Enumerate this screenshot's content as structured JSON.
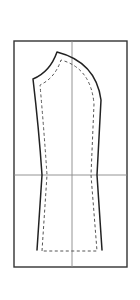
{
  "diagram": {
    "type": "sewing-pattern",
    "colors": {
      "frame": "#333333",
      "guide": "#888888",
      "outline": "#222222",
      "seam_allowance": "#555555",
      "background": "#ffffff"
    },
    "elements": [
      {
        "name": "outer-frame",
        "style": "solid"
      },
      {
        "name": "center-vertical-guide",
        "style": "thin"
      },
      {
        "name": "elbow-horizontal-guide",
        "style": "thin"
      },
      {
        "name": "sleeve-outline",
        "style": "solid"
      },
      {
        "name": "seam-line",
        "style": "dashed"
      }
    ]
  }
}
